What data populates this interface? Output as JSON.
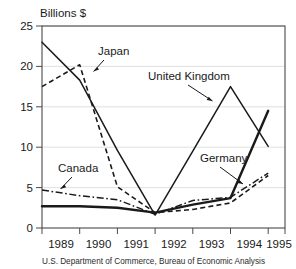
{
  "chart_data": {
    "type": "line",
    "title": "",
    "subtitle": "",
    "xlabel": "",
    "ylabel": "Billions $",
    "x": [
      1989,
      1990,
      1991,
      1992,
      1993,
      1994,
      1995
    ],
    "xtick_labels": [
      "1989",
      "1990",
      "1991",
      "1992",
      "1993",
      "1994",
      "1995"
    ],
    "ytick_labels": [
      "0",
      "5",
      "10",
      "15",
      "20",
      "25"
    ],
    "ytick_values": [
      0,
      5,
      10,
      15,
      20,
      25
    ],
    "ylim": [
      0,
      25
    ],
    "xlim": [
      1989,
      1995
    ],
    "grid": "horizontal",
    "legend_position": "inline-annotations",
    "series": [
      {
        "name": "United Kingdom",
        "style": "solid",
        "color": "#1a1a1a",
        "values": [
          23.0,
          18.3,
          9.6,
          1.6,
          9.5,
          17.5,
          10.1
        ]
      },
      {
        "name": "Japan",
        "style": "dashed",
        "color": "#1a1a1a",
        "values": [
          17.5,
          20.2,
          5.1,
          1.9,
          2.3,
          3.1,
          6.5
        ]
      },
      {
        "name": "Canada",
        "style": "dash-dot",
        "color": "#1a1a1a",
        "values": [
          4.7,
          4.0,
          3.5,
          1.7,
          3.4,
          3.8,
          6.8
        ]
      },
      {
        "name": "Germany",
        "style": "solid-thick",
        "color": "#1a1a1a",
        "values": [
          2.7,
          2.7,
          2.5,
          1.9,
          2.9,
          3.7,
          14.5
        ]
      }
    ],
    "annotations": [
      {
        "label": "Japan",
        "target_series": "Japan"
      },
      {
        "label": "United Kingdom",
        "target_series": "United Kingdom"
      },
      {
        "label": "Canada",
        "target_series": "Canada"
      },
      {
        "label": "Germany",
        "target_series": "Germany"
      }
    ],
    "source": "U.S. Department of Commerce, Bureau of Economic Analysis"
  },
  "axis": {
    "y_title": "Billions $",
    "y_labels": {
      "t0": "0",
      "t5": "5",
      "t10": "10",
      "t15": "15",
      "t20": "20",
      "t25": "25"
    },
    "x_labels": {
      "y1989": "1989",
      "y1990": "1990",
      "y1991": "1991",
      "y1992": "1992",
      "y1993": "1993",
      "y1994": "1994",
      "y1995": "1995"
    }
  },
  "annotations": {
    "japan": "Japan",
    "united_kingdom": "United Kingdom",
    "canada": "Canada",
    "germany": "Germany"
  },
  "footer": {
    "source": "U.S. Department of Commerce, Bureau of Economic Analysis"
  }
}
